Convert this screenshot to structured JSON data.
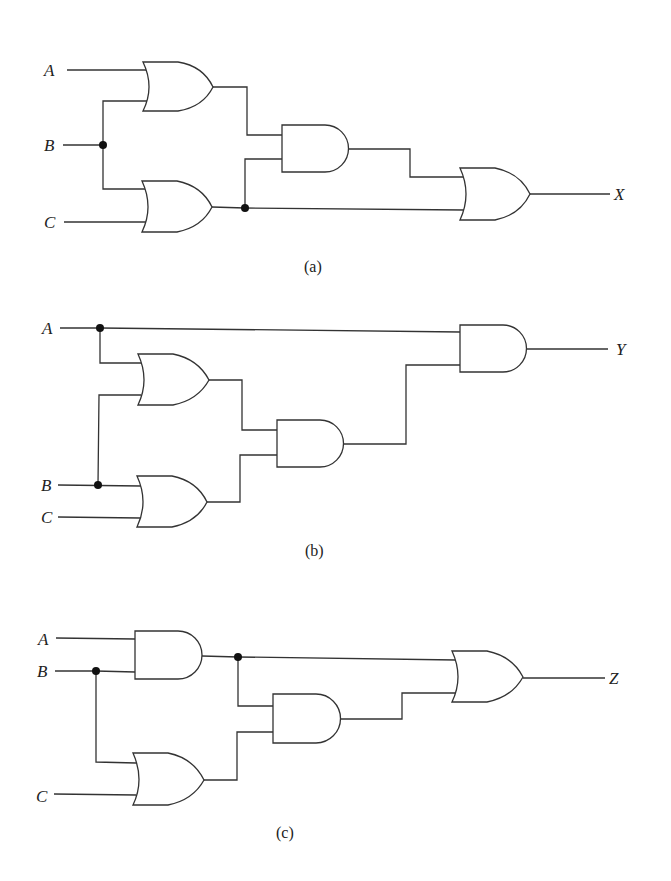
{
  "figure": {
    "panels": [
      {
        "caption": "(a)",
        "inputs": [
          "A",
          "B",
          "C"
        ],
        "output": "X",
        "gates": [
          {
            "id": "or1",
            "type": "OR",
            "inputs": [
              "A",
              "B"
            ]
          },
          {
            "id": "or2",
            "type": "OR",
            "inputs": [
              "B",
              "C"
            ]
          },
          {
            "id": "and1",
            "type": "AND",
            "inputs": [
              "or1",
              "or2"
            ]
          },
          {
            "id": "or3",
            "type": "OR",
            "inputs": [
              "and1",
              "or2"
            ]
          }
        ]
      },
      {
        "caption": "(b)",
        "inputs": [
          "A",
          "B",
          "C"
        ],
        "output": "Y",
        "gates": [
          {
            "id": "or1",
            "type": "OR",
            "inputs": [
              "A",
              "B"
            ]
          },
          {
            "id": "or2",
            "type": "OR",
            "inputs": [
              "B",
              "C"
            ]
          },
          {
            "id": "and1",
            "type": "AND",
            "inputs": [
              "or1",
              "or2"
            ]
          },
          {
            "id": "and2",
            "type": "AND",
            "inputs": [
              "A",
              "and1"
            ]
          }
        ]
      },
      {
        "caption": "(c)",
        "inputs": [
          "A",
          "B",
          "C"
        ],
        "output": "Z",
        "gates": [
          {
            "id": "and1",
            "type": "AND",
            "inputs": [
              "A",
              "B"
            ]
          },
          {
            "id": "or1",
            "type": "OR",
            "inputs": [
              "B",
              "C"
            ]
          },
          {
            "id": "and2",
            "type": "AND",
            "inputs": [
              "and1",
              "or1"
            ]
          },
          {
            "id": "or2",
            "type": "OR",
            "inputs": [
              "and1",
              "and2"
            ]
          }
        ]
      }
    ]
  },
  "labels": {
    "a": {
      "A": "A",
      "B": "B",
      "C": "C",
      "out": "X",
      "caption": "(a)"
    },
    "b": {
      "A": "A",
      "B": "B",
      "C": "C",
      "out": "Y",
      "caption": "(b)"
    },
    "c": {
      "A": "A",
      "B": "B",
      "C": "C",
      "out": "Z",
      "caption": "(c)"
    }
  }
}
